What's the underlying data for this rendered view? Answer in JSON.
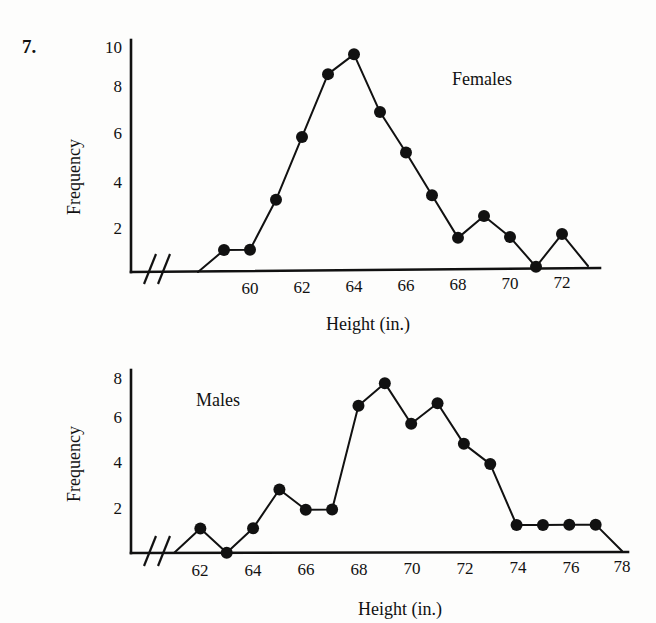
{
  "problem": {
    "number": "7."
  },
  "charts": [
    {
      "id": "females",
      "series_label": "Females",
      "ylabel": "Frequency",
      "xlabel": "Height (in.)",
      "y_ticks": [
        "2",
        "4",
        "6",
        "8",
        "10"
      ],
      "x_ticks": [
        "60",
        "62",
        "64",
        "66",
        "68",
        "70",
        "72"
      ]
    },
    {
      "id": "males",
      "series_label": "Males",
      "ylabel": "Frequency",
      "xlabel": "Height (in.)",
      "y_ticks": [
        "2",
        "4",
        "6",
        "8"
      ],
      "x_ticks": [
        "62",
        "64",
        "66",
        "68",
        "70",
        "72",
        "74",
        "76",
        "78"
      ]
    }
  ],
  "chart_data": [
    {
      "type": "line",
      "title": "Females",
      "xlabel": "Height (in.)",
      "ylabel": "Frequency",
      "xlim": [
        58,
        73
      ],
      "ylim": [
        0,
        10.5
      ],
      "x_ticks": [
        60,
        62,
        64,
        66,
        68,
        70,
        72
      ],
      "y_ticks": [
        2,
        4,
        6,
        8,
        10
      ],
      "grid": false,
      "axis_break_x": true,
      "legend": "none",
      "x": [
        58,
        59,
        60,
        61,
        62,
        63,
        64,
        65,
        66,
        67,
        68,
        69,
        70,
        71,
        72,
        73
      ],
      "values": [
        0,
        1,
        1,
        3.3,
        6.2,
        9.1,
        10,
        7.3,
        5.4,
        3.4,
        1.4,
        2.4,
        1.4,
        0,
        1.5,
        0
      ],
      "markers": [
        false,
        true,
        true,
        true,
        true,
        true,
        true,
        true,
        true,
        true,
        true,
        true,
        true,
        true,
        true,
        false
      ]
    },
    {
      "type": "line",
      "title": "Males",
      "xlabel": "Height (in.)",
      "ylabel": "Frequency",
      "xlim": [
        61,
        78
      ],
      "ylim": [
        0,
        8.6
      ],
      "x_ticks": [
        62,
        64,
        66,
        68,
        70,
        72,
        74,
        76,
        78
      ],
      "y_ticks": [
        2,
        4,
        6,
        8
      ],
      "grid": false,
      "axis_break_x": true,
      "legend": "none",
      "x": [
        61,
        62,
        63,
        64,
        65,
        66,
        67,
        68,
        69,
        70,
        71,
        72,
        73,
        74,
        75,
        76,
        77,
        78
      ],
      "values": [
        0,
        1.2,
        0,
        1.2,
        3.1,
        2.1,
        2.1,
        7.2,
        8.3,
        6.3,
        7.3,
        5.3,
        4.3,
        1.3,
        1.3,
        1.3,
        1.3,
        0
      ],
      "markers": [
        false,
        true,
        true,
        true,
        true,
        true,
        true,
        true,
        true,
        true,
        true,
        true,
        true,
        true,
        true,
        true,
        true,
        false
      ]
    }
  ]
}
